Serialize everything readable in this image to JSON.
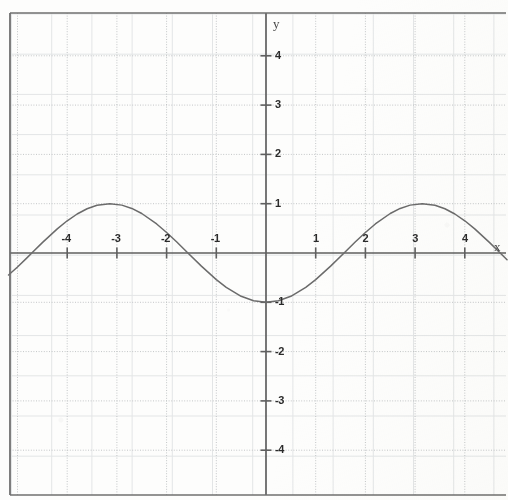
{
  "figure": {
    "title": "",
    "axis_labels": {
      "x": "x",
      "y": "y"
    },
    "frame": {
      "left": 10,
      "top": 13,
      "right": 506,
      "bottom": 495
    }
  },
  "chart_data": {
    "type": "line",
    "title": "",
    "xlabel": "x",
    "ylabel": "y",
    "expression": "y = -cos(x)",
    "xlim": [
      -5.18,
      4.85
    ],
    "ylim": [
      -4.88,
      4.85
    ],
    "xticks": [
      -4,
      -3,
      -2,
      -1,
      1,
      2,
      3,
      4
    ],
    "yticks": [
      -4,
      -3,
      -2,
      -1,
      1,
      2,
      3,
      4
    ],
    "xtick_labels": [
      "-4",
      "-3",
      "-2",
      "-1",
      "1",
      "2",
      "3",
      "4"
    ],
    "ytick_labels": [
      "-4",
      "-3",
      "-2",
      "-1",
      "1",
      "2",
      "3",
      "4"
    ],
    "grid": true,
    "grid_unit_spacing_px": 49.5,
    "legend": null,
    "series": [
      {
        "name": "y = -cos(x)",
        "color": "#6b6b6b",
        "amplitude": 1,
        "period": 6.2832,
        "phase_deg": 180,
        "midline": 0,
        "maxima": [
          [
            -3.1416,
            1
          ],
          [
            3.1416,
            1
          ]
        ],
        "minima": [
          [
            0,
            -1
          ]
        ],
        "zeros": [
          -4.712,
          -1.571,
          1.571,
          4.712
        ],
        "points": [
          [
            -5.18,
            0.445
          ],
          [
            -5.0,
            0.284
          ],
          [
            -4.8,
            0.088
          ],
          [
            -4.712,
            0.0
          ],
          [
            -4.5,
            -0.211
          ],
          [
            -4.2,
            -0.49
          ],
          [
            -4.0,
            -0.654
          ],
          [
            -3.8,
            -0.791
          ],
          [
            -3.6,
            -0.897
          ],
          [
            -3.4,
            -0.967
          ],
          [
            -3.1416,
            -1.0
          ],
          [
            -2.9,
            -0.971
          ],
          [
            -2.7,
            -0.904
          ],
          [
            -2.5,
            -0.801
          ],
          [
            -2.2,
            -0.589
          ],
          [
            -2.0,
            -0.416
          ],
          [
            -1.8,
            -0.227
          ],
          [
            -1.571,
            0.0
          ],
          [
            -1.3,
            0.267
          ],
          [
            -1.0,
            0.54
          ],
          [
            -0.8,
            0.697
          ],
          [
            -0.5,
            0.878
          ],
          [
            -0.25,
            0.969
          ],
          [
            0.0,
            1.0
          ],
          [
            0.25,
            0.969
          ],
          [
            0.5,
            0.878
          ],
          [
            0.8,
            0.697
          ],
          [
            1.0,
            0.54
          ],
          [
            1.3,
            0.267
          ],
          [
            1.571,
            0.0
          ],
          [
            1.8,
            -0.227
          ],
          [
            2.0,
            -0.416
          ],
          [
            2.2,
            -0.589
          ],
          [
            2.5,
            -0.801
          ],
          [
            2.7,
            -0.904
          ],
          [
            2.9,
            -0.971
          ],
          [
            3.1416,
            -1.0
          ],
          [
            3.4,
            -0.967
          ],
          [
            3.6,
            -0.897
          ],
          [
            3.8,
            -0.791
          ],
          [
            4.0,
            -0.654
          ],
          [
            4.2,
            -0.49
          ],
          [
            4.5,
            -0.211
          ],
          [
            4.712,
            0.0
          ],
          [
            4.85,
            0.138
          ]
        ],
        "note": "points listed as [x, cos(x)]; plotted value is -cos(x)"
      }
    ]
  },
  "render": {
    "origin_px": {
      "x": 266,
      "y": 253
    },
    "unit_px": {
      "x": 49.7,
      "y": 49.3
    },
    "colors": {
      "background": "#fdfdfc",
      "frame": "#6f6f6f",
      "axis": "#5f5f5f",
      "curve": "#6b6b6b",
      "grid_fine": "#e3e5e6",
      "grid_unit": "#b9bcbe",
      "label": "#2b2b2b"
    }
  }
}
